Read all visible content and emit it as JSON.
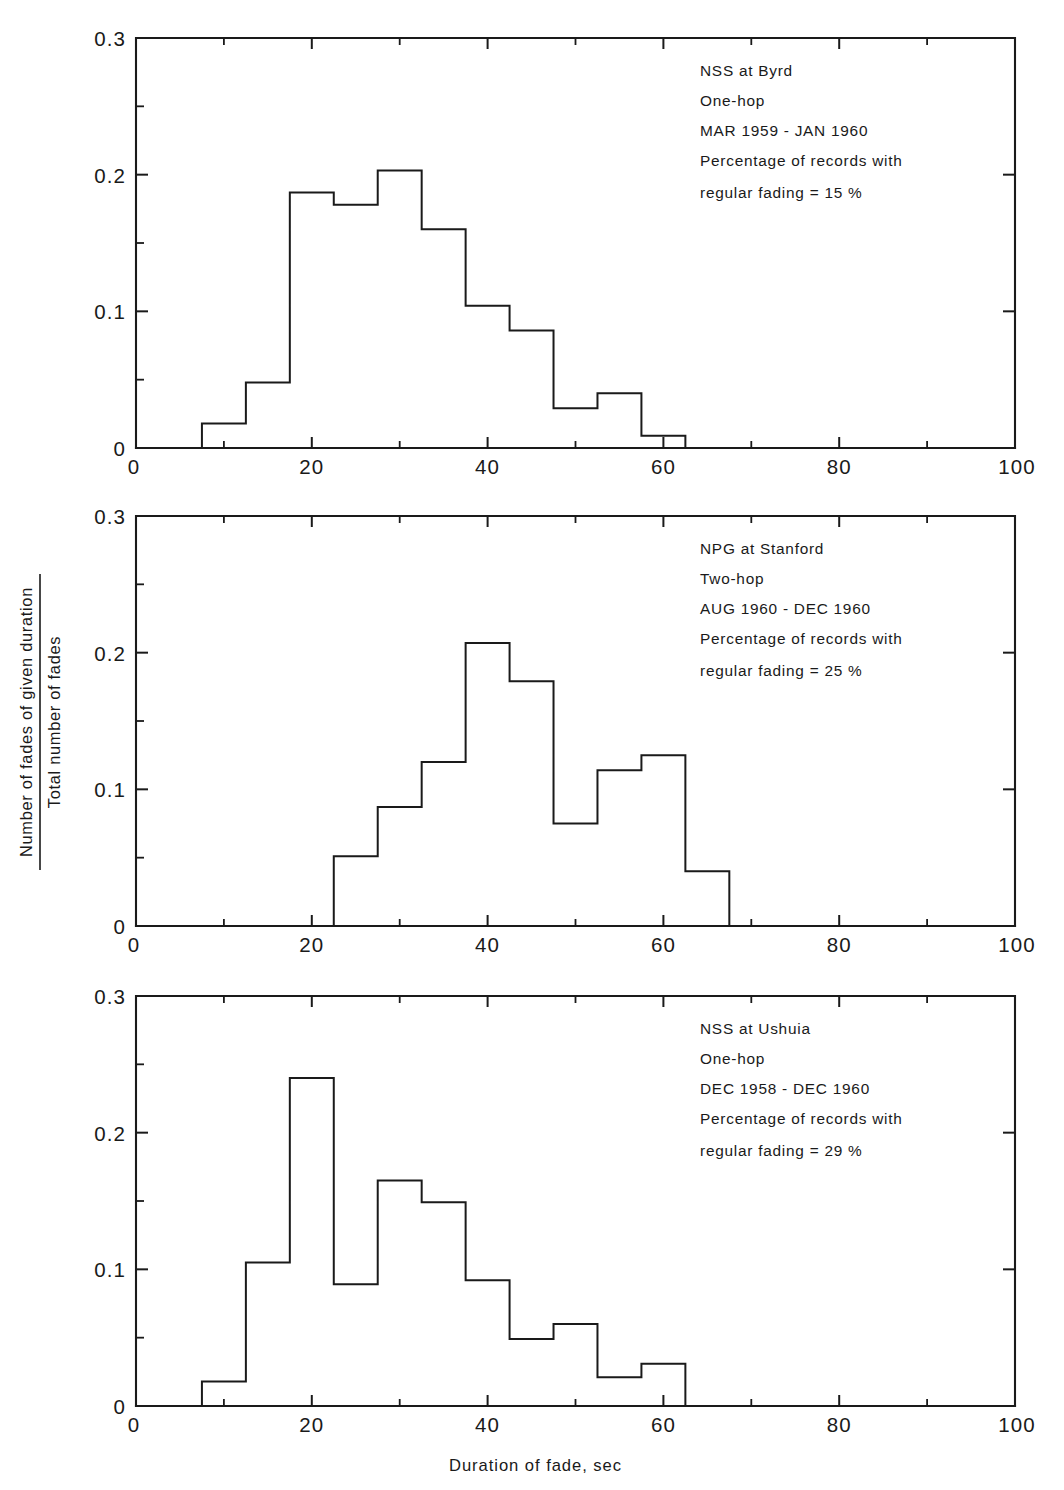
{
  "figure": {
    "x_axis_title": "Duration of fade, sec",
    "y_axis_title_numerator": "Number of fades of given duration",
    "y_axis_title_denominator": "Total number of fades",
    "x_ticks": [
      "0",
      "20",
      "40",
      "60",
      "80",
      "100"
    ],
    "y_ticks": [
      "0",
      "0.1",
      "0.2",
      "0.3"
    ]
  },
  "chart_data": [
    {
      "type": "bar",
      "panel": "top",
      "title": "NSS at Byrd",
      "annotations": [
        "NSS at Byrd",
        "One-hop",
        "MAR 1959 - JAN 1960",
        "Percentage of records with",
        "regular fading = 15 %"
      ],
      "xlabel": "Duration of fade, sec",
      "ylabel": "Number of fades of given duration / Total number of fades",
      "xlim": [
        0,
        100
      ],
      "ylim": [
        0,
        0.3
      ],
      "grid": false,
      "bin_width": 5,
      "bin_starts": [
        7.5,
        12.5,
        17.5,
        22.5,
        27.5,
        32.5,
        37.5,
        42.5,
        47.5,
        52.5,
        57.5
      ],
      "bin_centers": [
        10,
        15,
        20,
        25,
        30,
        35,
        40,
        45,
        50,
        55,
        60
      ],
      "categories": [
        "7.5-12.5",
        "12.5-17.5",
        "17.5-22.5",
        "22.5-27.5",
        "27.5-32.5",
        "32.5-37.5",
        "37.5-42.5",
        "42.5-47.5",
        "47.5-52.5",
        "52.5-57.5",
        "57.5-62.5"
      ],
      "values": [
        0.018,
        0.048,
        0.187,
        0.178,
        0.203,
        0.16,
        0.104,
        0.086,
        0.029,
        0.04,
        0.009
      ]
    },
    {
      "type": "bar",
      "panel": "middle",
      "title": "NPG at Stanford",
      "annotations": [
        "NPG at Stanford",
        "Two-hop",
        "AUG 1960 - DEC 1960",
        "Percentage of records with",
        "regular fading = 25 %"
      ],
      "xlabel": "Duration of fade, sec",
      "ylabel": "Number of fades of given duration / Total number of fades",
      "xlim": [
        0,
        100
      ],
      "ylim": [
        0,
        0.3
      ],
      "grid": false,
      "bin_width": 5,
      "bin_starts": [
        22.5,
        27.5,
        32.5,
        37.5,
        42.5,
        47.5,
        52.5,
        57.5,
        62.5
      ],
      "bin_centers": [
        25,
        30,
        35,
        40,
        45,
        50,
        55,
        60,
        65
      ],
      "categories": [
        "22.5-27.5",
        "27.5-32.5",
        "32.5-37.5",
        "37.5-42.5",
        "42.5-47.5",
        "47.5-52.5",
        "52.5-57.5",
        "57.5-62.5",
        "62.5-67.5"
      ],
      "values": [
        0.051,
        0.087,
        0.12,
        0.207,
        0.179,
        0.075,
        0.114,
        0.125,
        0.04
      ]
    },
    {
      "type": "bar",
      "panel": "bottom",
      "title": "NSS at Ushuia",
      "annotations": [
        "NSS at Ushuia",
        "One-hop",
        "DEC 1958 - DEC 1960",
        "Percentage of records with",
        "regular fading = 29 %"
      ],
      "xlabel": "Duration of fade, sec",
      "ylabel": "Number of fades of given duration / Total number of fades",
      "xlim": [
        0,
        100
      ],
      "ylim": [
        0,
        0.3
      ],
      "grid": false,
      "bin_width": 5,
      "bin_starts": [
        7.5,
        12.5,
        17.5,
        22.5,
        27.5,
        32.5,
        37.5,
        42.5,
        47.5,
        52.5,
        57.5
      ],
      "bin_centers": [
        10,
        15,
        20,
        25,
        30,
        35,
        40,
        45,
        50,
        55,
        60
      ],
      "categories": [
        "7.5-12.5",
        "12.5-17.5",
        "17.5-22.5",
        "22.5-27.5",
        "27.5-32.5",
        "32.5-37.5",
        "37.5-42.5",
        "42.5-47.5",
        "47.5-52.5",
        "52.5-57.5",
        "57.5-62.5"
      ],
      "values": [
        0.018,
        0.105,
        0.24,
        0.089,
        0.165,
        0.149,
        0.092,
        0.049,
        0.06,
        0.021,
        0.031
      ]
    }
  ],
  "layout": {
    "panels": [
      {
        "name": "top",
        "left": 136,
        "right": 1015,
        "top": 38,
        "bottom": 448
      },
      {
        "name": "middle",
        "left": 136,
        "right": 1015,
        "top": 516,
        "bottom": 926
      },
      {
        "name": "bottom",
        "left": 136,
        "right": 1015,
        "top": 996,
        "bottom": 1406
      }
    ],
    "annotation_x": 700,
    "annotation_start_offsets": [
      38,
      68,
      98,
      128,
      160
    ]
  }
}
